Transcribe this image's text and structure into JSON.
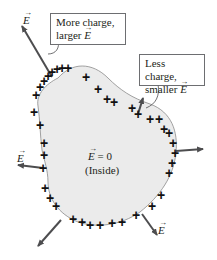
{
  "diagram": {
    "colors": {
      "conductor_fill": "#ebebeb",
      "conductor_outline": "#8a8a8a",
      "arrow": "#4d4d4f",
      "text": "#231f20",
      "box_border": "#6d6e71"
    },
    "callouts": [
      {
        "id": "more-charge",
        "line1": "More charge,",
        "line2_prefix": "larger ",
        "line2_symbol": "E"
      },
      {
        "id": "less-charge",
        "line1": "Less charge,",
        "line2_prefix": "smaller ",
        "line2_symbol": "E"
      }
    ],
    "inside_label": {
      "field": "E",
      "equals": " = 0",
      "note": "(Inside)"
    },
    "field_vector_symbol": "E",
    "charge_symbol": "+",
    "field_vectors": [
      {
        "location": "top-left",
        "relative_length": "long",
        "labeled": true
      },
      {
        "location": "upper-right",
        "relative_length": "short",
        "labeled": false
      },
      {
        "location": "left",
        "relative_length": "medium",
        "labeled": true
      },
      {
        "location": "right",
        "relative_length": "medium",
        "labeled": false
      },
      {
        "location": "bottom-left",
        "relative_length": "medium",
        "labeled": false
      },
      {
        "location": "bottom-right",
        "relative_length": "medium",
        "labeled": true
      }
    ]
  }
}
